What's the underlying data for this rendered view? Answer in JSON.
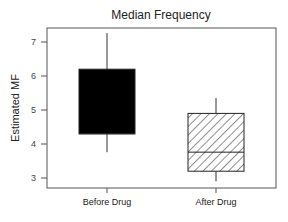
{
  "chart_data": {
    "type": "box",
    "title": "Median Frequency",
    "xlabel": "",
    "ylabel": "Estimated MF",
    "ylim": [
      2.7,
      7.45
    ],
    "yticks": [
      3,
      4,
      5,
      6,
      7
    ],
    "grid": false,
    "legend": null,
    "categories": [
      "Before Drug",
      "After Drug"
    ],
    "series": [
      {
        "name": "Before Drug",
        "whisker_low": 3.76,
        "q1": 4.3,
        "median": 4.3,
        "q3": 6.2,
        "whisker_high": 7.26,
        "fill": "solid-black"
      },
      {
        "name": "After Drug",
        "whisker_low": 2.9,
        "q1": 3.2,
        "median": 3.76,
        "q3": 4.9,
        "whisker_high": 5.35,
        "fill": "diagonal-hatch"
      }
    ]
  },
  "colors": {
    "axis": "#555555",
    "box_solid": "#000000",
    "hatch": "#222222",
    "text": "#222222"
  }
}
